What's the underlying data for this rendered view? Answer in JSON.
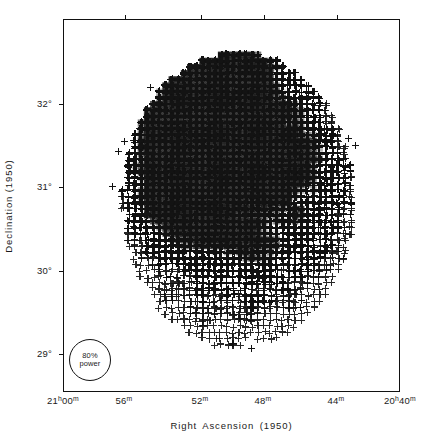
{
  "figure": {
    "kind": "radio-intensity-map",
    "symbol": "plus-sign"
  },
  "axes": {
    "x_title": "Right Ascension (1950)",
    "y_title": "Declination (1950)",
    "x_ticks": [
      {
        "label_main": "21",
        "label_unit_h": "h",
        "label_min": "00",
        "label_unit_m": "m",
        "pos_px": 63
      },
      {
        "label_main": "",
        "label_unit_h": "",
        "label_min": "56",
        "label_unit_m": "m",
        "pos_px": 124
      },
      {
        "label_main": "",
        "label_unit_h": "",
        "label_min": "52",
        "label_unit_m": "m",
        "pos_px": 200
      },
      {
        "label_main": "",
        "label_unit_h": "",
        "label_min": "48",
        "label_unit_m": "m",
        "pos_px": 263
      },
      {
        "label_main": "",
        "label_unit_h": "",
        "label_min": "44",
        "label_unit_m": "m",
        "pos_px": 336
      },
      {
        "label_main": "20",
        "label_unit_h": "h",
        "label_min": "40",
        "label_unit_m": "m",
        "pos_px": 400
      }
    ],
    "y_ticks": [
      {
        "label": "32°",
        "pos_px": 103
      },
      {
        "label": "31°",
        "pos_px": 186
      },
      {
        "label": "30°",
        "pos_px": 270
      },
      {
        "label": "29°",
        "pos_px": 353
      }
    ]
  },
  "beam": {
    "line1": "80%",
    "line2": "power"
  },
  "chart_data": {
    "type": "heatmap",
    "title": "",
    "xlabel": "Right Ascension (1950)",
    "ylabel": "Declination (1950)",
    "xlim": [
      "21h00m",
      "20h40m"
    ],
    "ylim": [
      "28.6°",
      "32.5°"
    ],
    "grid": false,
    "legend": "none",
    "marker": "+",
    "encoding": "overprinted plus-signs; density encodes intensity",
    "xtick_labels": [
      "21h00m",
      "56m",
      "52m",
      "48m",
      "44m",
      "20h40m"
    ],
    "ytick_labels": [
      "32°",
      "31°",
      "30°",
      "29°"
    ],
    "annotations": [
      {
        "text": "80% power",
        "type": "beam-size-circle",
        "x_px": 89,
        "y_px": 359
      }
    ],
    "intensity_levels": [
      0,
      1,
      2,
      3,
      4,
      5
    ],
    "grid_step_px": 6.2,
    "source_extent": {
      "cx_px": 238,
      "cy_px": 200,
      "rx_px": 110,
      "ry_px": 140
    },
    "outliers": [
      {
        "x_px": 150,
        "y_px": 87
      },
      {
        "x_px": 124,
        "y_px": 141
      },
      {
        "x_px": 118,
        "y_px": 151
      },
      {
        "x_px": 112,
        "y_px": 186
      },
      {
        "x_px": 349,
        "y_px": 138
      },
      {
        "x_px": 356,
        "y_px": 145
      },
      {
        "x_px": 252,
        "y_px": 349
      },
      {
        "x_px": 233,
        "y_px": 344
      }
    ],
    "density_field_note": "Elliptical Cygnus-region source; darkest (saturated) lobes in upper-left and upper-centre, a second dark ridge along the left flank and mid-right, with mottled lower-intensity structure in the south and a narrow tail extending below Dec 29.4°."
  }
}
